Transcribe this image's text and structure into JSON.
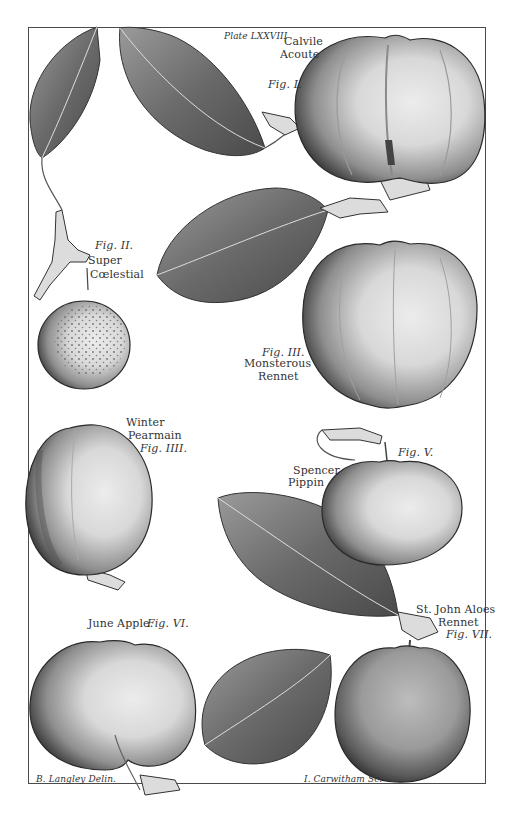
{
  "plate": {
    "plate_number": "Plate LXXVIII",
    "delineator": "B. Langley Delin.",
    "engraver": "I. Carwitham Sc."
  },
  "figures": [
    {
      "fig": "Fig. I.",
      "name_line1": "Calvile",
      "name_line2": "Acoute"
    },
    {
      "fig": "Fig. II.",
      "name_line1": "Super",
      "name_line2": "Cœlestial"
    },
    {
      "fig": "Fig. III.",
      "name_line1": "Monsterous",
      "name_line2": "Rennet"
    },
    {
      "fig": "Fig. IIII.",
      "name_line1": "Winter",
      "name_line2": "Pearmain"
    },
    {
      "fig": "Fig. V.",
      "name_line1": "Spencer",
      "name_line2": "Pippin"
    },
    {
      "fig": "Fig. VI.",
      "name_line1": "June Apple.",
      "name_line2": ""
    },
    {
      "fig": "Fig. VII.",
      "name_line1": "St. John Aloes",
      "name_line2": "Rennet"
    }
  ],
  "colors": {
    "ink": "#2a2a2a",
    "paper": "#ffffff",
    "shade_dark": "#3a3a3a",
    "shade_mid": "#8a8a8a",
    "highlight": "#e4e4e4"
  }
}
